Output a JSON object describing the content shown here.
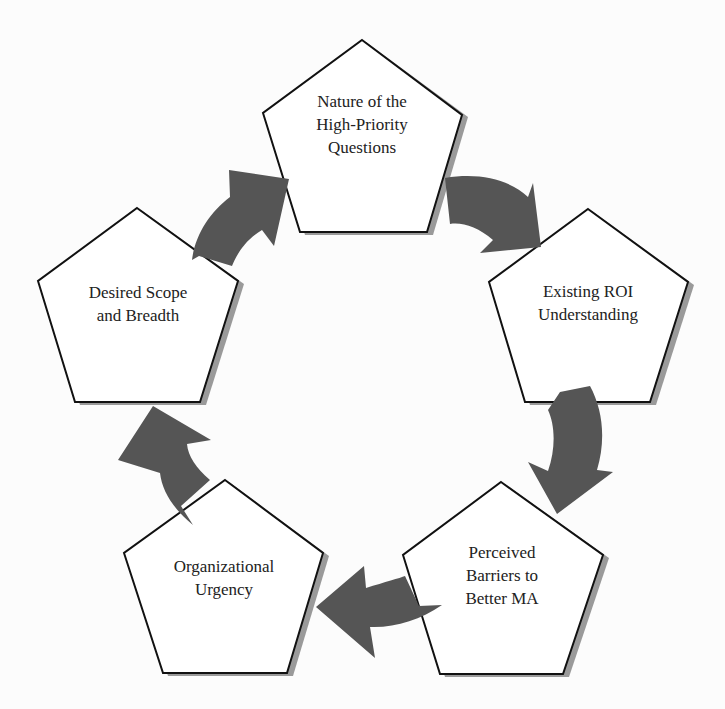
{
  "diagram": {
    "type": "cycle",
    "direction": "clockwise",
    "colors": {
      "arrow": "#555555",
      "pentagon_fill": "#ffffff",
      "pentagon_stroke": "#111111",
      "shadow": "#9a9a9a",
      "background": "#fcfcfc"
    },
    "nodes": [
      {
        "id": "nature",
        "lines": [
          "Nature of the",
          "High-Priority",
          "Questions"
        ]
      },
      {
        "id": "roi",
        "lines": [
          "Existing ROI",
          "Understanding"
        ]
      },
      {
        "id": "barriers",
        "lines": [
          "Perceived",
          "Barriers to",
          "Better MA"
        ]
      },
      {
        "id": "urgency",
        "lines": [
          "Organizational",
          "Urgency"
        ]
      },
      {
        "id": "scope",
        "lines": [
          "Desired Scope",
          "and Breadth"
        ]
      }
    ],
    "edges": [
      {
        "from": "nature",
        "to": "roi"
      },
      {
        "from": "roi",
        "to": "barriers"
      },
      {
        "from": "barriers",
        "to": "urgency"
      },
      {
        "from": "urgency",
        "to": "scope"
      },
      {
        "from": "scope",
        "to": "nature"
      }
    ]
  }
}
